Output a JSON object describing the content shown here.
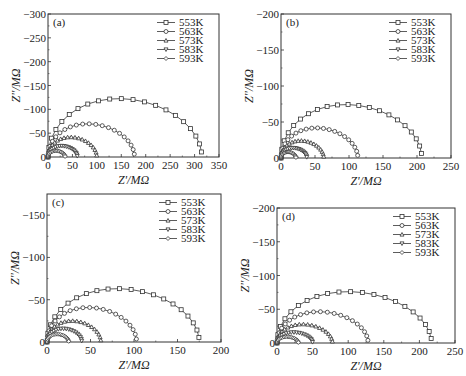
{
  "chart_data": [
    {
      "type": "scatter",
      "panel": "(a)",
      "title": "",
      "xlabel": "Z'/MΩ",
      "ylabel": "Z''/MΩ",
      "xlim": [
        0,
        350
      ],
      "ylim": [
        0,
        -300
      ],
      "xticks": [
        0,
        50,
        100,
        150,
        200,
        250,
        300,
        350
      ],
      "yticks": [
        0,
        -50,
        -100,
        -150,
        -200,
        -250,
        -300
      ],
      "legend_position": "upper right",
      "series": [
        {
          "name": "553K",
          "marker": "square",
          "diameter": 315,
          "peak": -132
        },
        {
          "name": "563K",
          "marker": "circle",
          "diameter": 177,
          "peak": -75
        },
        {
          "name": "573K",
          "marker": "triangle-up",
          "diameter": 100,
          "peak": -45
        },
        {
          "name": "583K",
          "marker": "triangle-down",
          "diameter": 60,
          "peak": -25
        },
        {
          "name": "593K",
          "marker": "diamond",
          "diameter": 35,
          "peak": -14
        }
      ]
    },
    {
      "type": "scatter",
      "panel": "(b)",
      "title": "",
      "xlabel": "Z'/MΩ",
      "ylabel": "Z''/MΩ",
      "xlim": [
        0,
        250
      ],
      "ylim": [
        0,
        -200
      ],
      "xticks": [
        0,
        50,
        100,
        150,
        200,
        250
      ],
      "yticks": [
        0,
        -50,
        -100,
        -150,
        -200
      ],
      "legend_position": "upper right",
      "series": [
        {
          "name": "553K",
          "marker": "square",
          "diameter": 207,
          "peak": -80
        },
        {
          "name": "563K",
          "marker": "circle",
          "diameter": 113,
          "peak": -45
        },
        {
          "name": "573K",
          "marker": "triangle-up",
          "diameter": 63,
          "peak": -26
        },
        {
          "name": "583K",
          "marker": "triangle-down",
          "diameter": 38,
          "peak": -15
        },
        {
          "name": "593K",
          "marker": "diamond",
          "diameter": 22,
          "peak": -9
        }
      ]
    },
    {
      "type": "scatter",
      "panel": "(c)",
      "title": "",
      "xlabel": "Z'/MΩ",
      "ylabel": "Z''/MΩ",
      "xlim": [
        0,
        200
      ],
      "ylim": [
        0,
        -175
      ],
      "xticks": [
        0,
        50,
        100,
        150,
        200
      ],
      "yticks": [
        0,
        -50,
        -100,
        -150
      ],
      "legend_position": "upper right",
      "series": [
        {
          "name": "553K",
          "marker": "square",
          "diameter": 175,
          "peak": -68
        },
        {
          "name": "563K",
          "marker": "circle",
          "diameter": 103,
          "peak": -44
        },
        {
          "name": "573K",
          "marker": "triangle-up",
          "diameter": 62,
          "peak": -27
        },
        {
          "name": "583K",
          "marker": "triangle-down",
          "diameter": 40,
          "peak": -17
        },
        {
          "name": "593K",
          "marker": "diamond",
          "diameter": 25,
          "peak": -10
        }
      ]
    },
    {
      "type": "scatter",
      "panel": "(d)",
      "title": "",
      "xlabel": "Z'/MΩ",
      "ylabel": "Z''/MΩ",
      "xlim": [
        0,
        250
      ],
      "ylim": [
        0,
        -200
      ],
      "xticks": [
        0,
        50,
        100,
        150,
        200,
        250
      ],
      "yticks": [
        0,
        -50,
        -100,
        -150,
        -200
      ],
      "legend_position": "upper right",
      "series": [
        {
          "name": "553K",
          "marker": "square",
          "diameter": 217,
          "peak": -82
        },
        {
          "name": "563K",
          "marker": "circle",
          "diameter": 128,
          "peak": -50
        },
        {
          "name": "573K",
          "marker": "triangle-up",
          "diameter": 78,
          "peak": -30
        },
        {
          "name": "583K",
          "marker": "triangle-down",
          "diameter": 50,
          "peak": -17
        },
        {
          "name": "593K",
          "marker": "diamond",
          "diameter": 30,
          "peak": -10
        }
      ]
    }
  ],
  "layout": {
    "panels": [
      {
        "x0": 48,
        "y0": 14,
        "x1": 219,
        "y1": 157
      },
      {
        "x0": 281,
        "y0": 14,
        "x1": 451,
        "y1": 158
      },
      {
        "x0": 47,
        "y0": 194,
        "x1": 221,
        "y1": 342
      },
      {
        "x0": 277,
        "y0": 208,
        "x1": 455,
        "y1": 343
      }
    ],
    "line_color": "#333333"
  }
}
